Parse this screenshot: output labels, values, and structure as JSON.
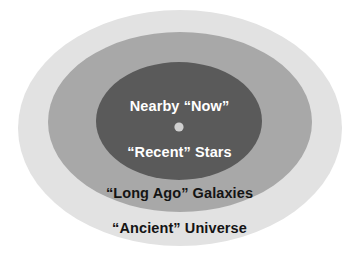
{
  "diagram": {
    "type": "concentric-ellipse-diagram",
    "background_color": "#ffffff",
    "center_marker": {
      "name": "observer-dot",
      "color": "#cfcfcf",
      "cx": 179,
      "cy": 127,
      "r": 4.6
    },
    "rings": [
      {
        "id": "ancient-universe",
        "label": "“Ancient” Universe",
        "fill": "#e2e2e2",
        "text_color": "#141414",
        "cx": 180,
        "cy": 128,
        "rx": 162,
        "ry": 118,
        "order": 1
      },
      {
        "id": "long-ago-galaxies",
        "label": "“Long Ago” Galaxies",
        "fill": "#a8a8a8",
        "text_color": "#141414",
        "cx": 180,
        "cy": 122,
        "rx": 132,
        "ry": 90,
        "order": 2
      },
      {
        "id": "recent-stars",
        "label": "“Recent” Stars",
        "fill": "#5a5a5a",
        "text_color": "#ffffff",
        "cx": 179,
        "cy": 121,
        "rx": 83,
        "ry": 59,
        "order": 3
      }
    ],
    "labels": {
      "nearby_now": "Nearby “Now”",
      "recent_stars": "“Recent” Stars",
      "long_ago_galaxies": "“Long Ago” Galaxies",
      "ancient_universe": "“Ancient” Universe"
    }
  }
}
